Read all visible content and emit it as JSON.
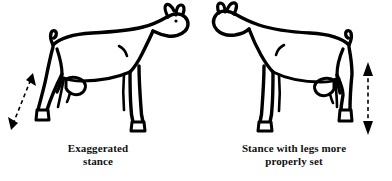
{
  "figure": {
    "type": "line-drawing",
    "background_color": "#ffffff",
    "ink_color": "#000000",
    "panels": [
      {
        "id": "left",
        "caption_lines": [
          "Exaggerated",
          "stance"
        ],
        "animal": {
          "species": "goat",
          "facing": "right",
          "rear_leg_set": "angled far back and out",
          "udder": "small, shown at flank"
        },
        "annotation": {
          "kind": "double-headed-arrow",
          "style": "dashed",
          "orientation": "diagonal",
          "position": "left of rear leg",
          "meaning": "rear leg angled away from body"
        }
      },
      {
        "id": "right",
        "caption_lines": [
          "Stance with legs more",
          "properly set"
        ],
        "animal": {
          "species": "goat",
          "facing": "left",
          "rear_leg_set": "set more nearly vertical under body",
          "udder": "small, shown at flank"
        },
        "annotation": {
          "kind": "double-headed-arrow",
          "style": "dashed",
          "orientation": "vertical",
          "position": "right of rear leg",
          "meaning": "rear leg set plumb beneath the hip"
        }
      }
    ]
  }
}
